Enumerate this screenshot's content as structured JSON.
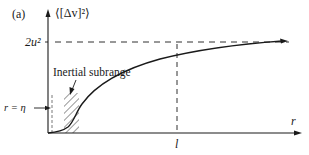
{
  "figure": {
    "panel_label": "(a)",
    "y_axis_label": "⟨[Δv]²⟩",
    "x_axis_label": "r",
    "level_label": "2u²",
    "x_marker_label": "l",
    "eta_label": "r = η",
    "region_label": "Inertial subrange"
  },
  "colors": {
    "ink": "#1a1a1a",
    "background": "#ffffff"
  }
}
